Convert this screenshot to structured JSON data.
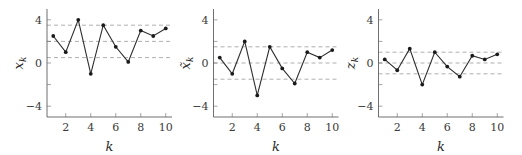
{
  "chart_data": [
    {
      "type": "line",
      "panel": "left",
      "xlabel": "k",
      "ylabel": "x_k",
      "ylabel_base": "x",
      "ylabel_accent": "",
      "ylabel_sub": "k",
      "x": [
        1,
        2,
        3,
        4,
        5,
        6,
        7,
        8,
        9,
        10
      ],
      "series": [
        {
          "name": "x_k",
          "values": [
            2.5,
            1.0,
            4.0,
            -1.0,
            3.5,
            1.5,
            0.1,
            3.0,
            2.5,
            3.2
          ]
        }
      ],
      "reference_lines": [
        3.5,
        2.0,
        0.5
      ],
      "xticks": [
        2,
        4,
        6,
        8,
        10
      ],
      "yticks": [
        -4,
        0,
        4
      ],
      "yminor_ticks": [
        -2,
        2
      ],
      "xlim": [
        0.5,
        10.5
      ],
      "ylim": [
        -5,
        5
      ],
      "grid": false,
      "legend": "none"
    },
    {
      "type": "line",
      "panel": "middle",
      "xlabel": "k",
      "ylabel": "x̃_k",
      "ylabel_base": "x",
      "ylabel_accent": "~",
      "ylabel_sub": "k",
      "x": [
        1,
        2,
        3,
        4,
        5,
        6,
        7,
        8,
        9,
        10
      ],
      "series": [
        {
          "name": "x̃_k",
          "values": [
            0.5,
            -1.0,
            2.0,
            -3.0,
            1.5,
            -0.5,
            -1.9,
            1.0,
            0.5,
            1.2
          ]
        }
      ],
      "reference_lines": [
        1.5,
        0.0,
        -1.5
      ],
      "xticks": [
        2,
        4,
        6,
        8,
        10
      ],
      "yticks": [
        -4,
        0,
        4
      ],
      "yminor_ticks": [
        -2,
        2
      ],
      "xlim": [
        0.5,
        10.5
      ],
      "ylim": [
        -5,
        5
      ],
      "grid": false,
      "legend": "none"
    },
    {
      "type": "line",
      "panel": "right",
      "xlabel": "k",
      "ylabel": "z_k",
      "ylabel_base": "z",
      "ylabel_accent": "",
      "ylabel_sub": "k",
      "x": [
        1,
        2,
        3,
        4,
        5,
        6,
        7,
        8,
        9,
        10
      ],
      "series": [
        {
          "name": "z_k",
          "values": [
            0.33,
            -0.67,
            1.33,
            -2.0,
            1.0,
            -0.33,
            -1.27,
            0.67,
            0.33,
            0.8
          ]
        }
      ],
      "reference_lines": [
        1.0,
        0.0,
        -1.0
      ],
      "xticks": [
        2,
        4,
        6,
        8,
        10
      ],
      "yticks": [
        -4,
        0,
        4
      ],
      "yminor_ticks": [
        -2,
        2
      ],
      "xlim": [
        0.5,
        10.5
      ],
      "ylim": [
        -5,
        5
      ],
      "grid": false,
      "legend": "none"
    }
  ],
  "layout": {
    "panels_left_px": [
      47,
      213.5,
      378.5
    ],
    "panel_width_px": 125,
    "plot_top_px": 9,
    "plot_bottom_px": 117
  }
}
